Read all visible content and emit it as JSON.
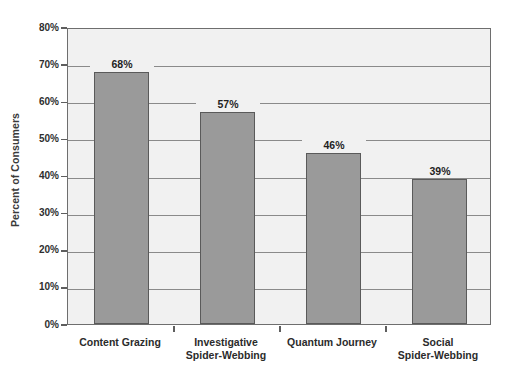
{
  "chart_data": {
    "type": "bar",
    "title": "",
    "subtitle": "",
    "xlabel": "",
    "ylabel": "Percent of Consumers",
    "ylim": [
      0,
      80
    ],
    "ytick_labels": [
      "0%",
      "10%",
      "20%",
      "30%",
      "40%",
      "50%",
      "60%",
      "70%",
      "80%"
    ],
    "ytick_values": [
      0,
      10,
      20,
      30,
      40,
      50,
      60,
      70,
      80
    ],
    "grid": true,
    "legend": "none",
    "categories": [
      "Content Grazing",
      "Investigative\nSpider-Webbing",
      "Quantum Journey",
      "Social\nSpider-Webbing"
    ],
    "values": [
      68,
      57,
      46,
      39
    ],
    "value_labels": [
      "68%",
      "57%",
      "46%",
      "39%"
    ],
    "colors": {
      "bar_fill": "#9a9a9a",
      "bar_stroke": "#5a5a5a",
      "plot_background": "#f1f1f1",
      "gridline": "#8a8a8a",
      "axis": "#6e6e6e",
      "text": "#2b2b2b",
      "page_background": "#ffffff"
    }
  }
}
